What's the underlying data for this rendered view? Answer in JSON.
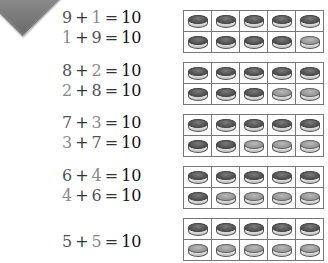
{
  "badge": {
    "text": "WAY"
  },
  "colors": {
    "dark_counter": "#555555",
    "light_counter": "#9a9a9a",
    "frame_border": "#777777",
    "light_digit": "#8a8a8a",
    "dark_digit": "#555555"
  },
  "equations": [
    {
      "lines": [
        {
          "a": "9",
          "b": "1",
          "sum": "10",
          "a_tone": "dark",
          "b_tone": "light"
        },
        {
          "a": "1",
          "b": "9",
          "sum": "10",
          "a_tone": "light",
          "b_tone": "dark"
        }
      ],
      "frame": {
        "top": [
          "dark",
          "dark",
          "dark",
          "dark",
          "dark"
        ],
        "bottom": [
          "dark",
          "dark",
          "dark",
          "dark",
          "light"
        ]
      }
    },
    {
      "lines": [
        {
          "a": "8",
          "b": "2",
          "sum": "10",
          "a_tone": "dark",
          "b_tone": "light"
        },
        {
          "a": "2",
          "b": "8",
          "sum": "10",
          "a_tone": "light",
          "b_tone": "dark"
        }
      ],
      "frame": {
        "top": [
          "dark",
          "dark",
          "dark",
          "dark",
          "dark"
        ],
        "bottom": [
          "dark",
          "dark",
          "dark",
          "light",
          "light"
        ]
      }
    },
    {
      "lines": [
        {
          "a": "7",
          "b": "3",
          "sum": "10",
          "a_tone": "dark",
          "b_tone": "light"
        },
        {
          "a": "3",
          "b": "7",
          "sum": "10",
          "a_tone": "light",
          "b_tone": "dark"
        }
      ],
      "frame": {
        "top": [
          "dark",
          "dark",
          "dark",
          "dark",
          "dark"
        ],
        "bottom": [
          "dark",
          "dark",
          "light",
          "light",
          "light"
        ]
      }
    },
    {
      "lines": [
        {
          "a": "6",
          "b": "4",
          "sum": "10",
          "a_tone": "dark",
          "b_tone": "light"
        },
        {
          "a": "4",
          "b": "6",
          "sum": "10",
          "a_tone": "light",
          "b_tone": "dark"
        }
      ],
      "frame": {
        "top": [
          "dark",
          "dark",
          "dark",
          "dark",
          "dark"
        ],
        "bottom": [
          "dark",
          "light",
          "light",
          "light",
          "light"
        ]
      }
    },
    {
      "lines": [
        {
          "a": "5",
          "b": "5",
          "sum": "10",
          "a_tone": "dark",
          "b_tone": "light"
        }
      ],
      "frame": {
        "top": [
          "dark",
          "dark",
          "dark",
          "dark",
          "dark"
        ],
        "bottom": [
          "light",
          "light",
          "light",
          "light",
          "light"
        ]
      }
    }
  ],
  "symbols": {
    "plus": "+",
    "equals": "="
  }
}
